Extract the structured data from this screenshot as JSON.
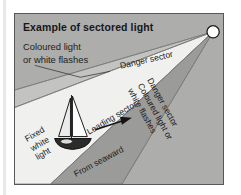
{
  "figure": {
    "title": "Example of sectored light",
    "background_color": "#adadab",
    "border_color": "#58585a",
    "leading_sector_color": "#f0f0ee",
    "danger_sector_color": "#9b9b99",
    "labels": {
      "caption_upper_left_line1": "Coloured light",
      "caption_upper_left_line2": "or white flashes",
      "danger_sector_top": "Danger sector",
      "leading_sector": "Leading sector",
      "danger_sector_right_line1": "Danger sector",
      "danger_sector_right_line2": "Coloured light or",
      "danger_sector_right_line3": "white flashes",
      "fixed_white_light_line1": "Fixed",
      "fixed_white_light_line2": "white",
      "fixed_white_light_line3": "light",
      "from_seaward": "From seaward"
    },
    "elements": {
      "light_source": "lighthouse-light",
      "vessel": "sailboat",
      "direction_arrow": "heading-arrow"
    }
  }
}
